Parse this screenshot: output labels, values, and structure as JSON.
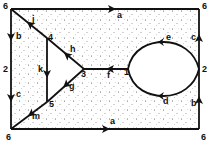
{
  "diagram": {
    "vertices": [
      {
        "id": "v6_tl",
        "label": "6",
        "x": 11,
        "y": 9,
        "lx": 3,
        "ly": 9
      },
      {
        "id": "v6_tr",
        "label": "6",
        "x": 199,
        "y": 9,
        "lx": 202,
        "ly": 9
      },
      {
        "id": "v6_br",
        "label": "6",
        "x": 199,
        "y": 129,
        "lx": 201,
        "ly": 140
      },
      {
        "id": "v6_bl",
        "label": "6",
        "x": 11,
        "y": 129,
        "lx": 6,
        "ly": 140
      },
      {
        "id": "v2_l",
        "label": "2",
        "x": 11,
        "y": 69,
        "lx": 3,
        "ly": 72
      },
      {
        "id": "v2_r",
        "label": "2",
        "x": 199,
        "y": 69,
        "lx": 202,
        "ly": 72
      },
      {
        "id": "v4",
        "label": "4",
        "x": 47,
        "y": 38,
        "lx": 48,
        "ly": 40
      },
      {
        "id": "v5",
        "label": "5",
        "x": 47,
        "y": 102,
        "lx": 49,
        "ly": 107
      },
      {
        "id": "v3",
        "label": "3",
        "x": 84,
        "y": 69,
        "lx": 81,
        "ly": 77
      },
      {
        "id": "v1",
        "label": "1",
        "x": 128,
        "y": 69,
        "lx": 124,
        "ly": 75
      }
    ],
    "edges": [
      {
        "id": "a_top",
        "label": "a",
        "lx": 117,
        "ly": 18
      },
      {
        "id": "a_bottom",
        "label": "a",
        "lx": 110,
        "ly": 124
      },
      {
        "id": "b_left",
        "label": "b",
        "lx": 16,
        "ly": 39
      },
      {
        "id": "b_right",
        "label": "b",
        "lx": 191,
        "ly": 106
      },
      {
        "id": "c_left",
        "label": "c",
        "lx": 16,
        "ly": 97
      },
      {
        "id": "c_right",
        "label": "c",
        "lx": 191,
        "ly": 40
      },
      {
        "id": "d",
        "label": "d",
        "lx": 163,
        "ly": 104
      },
      {
        "id": "e",
        "label": "e",
        "lx": 166,
        "ly": 40
      },
      {
        "id": "f",
        "label": "f",
        "lx": 107,
        "ly": 78
      },
      {
        "id": "g",
        "label": "g",
        "lx": 69,
        "ly": 89
      },
      {
        "id": "h",
        "label": "h",
        "lx": 70,
        "ly": 52
      },
      {
        "id": "j",
        "label": "j",
        "lx": 32,
        "ly": 22
      },
      {
        "id": "k",
        "label": "k",
        "lx": 38,
        "ly": 72
      },
      {
        "id": "m",
        "label": "m",
        "lx": 32,
        "ly": 119
      }
    ],
    "colors": {
      "line": "#111111",
      "stipple": "#333333",
      "background": "#ffffff"
    }
  }
}
